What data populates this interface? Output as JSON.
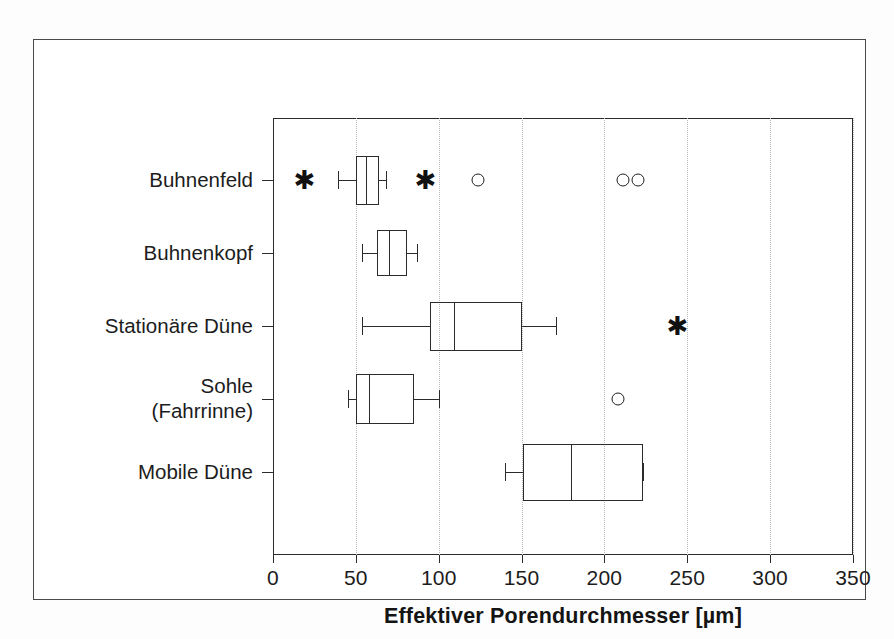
{
  "chart_data": {
    "type": "box",
    "title": "",
    "xlabel": "Effektiver Porendurchmesser [µm]",
    "ylabel": "",
    "xlim": [
      0,
      350
    ],
    "xticks": [
      0,
      50,
      100,
      150,
      200,
      250,
      300,
      350
    ],
    "xticklabels": [
      "0",
      "50",
      "100",
      "150",
      "200",
      "250",
      "300",
      "350"
    ],
    "grid": "vertical dotted gridlines at each x tick",
    "orientation": "horizontal",
    "legend": "none",
    "categories": [
      "Buhnenfeld",
      "Buhnenkopf",
      "Stationäre Düne",
      "Sohle\n(Fahrrinne)",
      "Mobile Düne"
    ],
    "boxes": [
      {
        "category": "Buhnenfeld",
        "whisker_low": 39,
        "q1": 50,
        "median": 56,
        "q3": 64,
        "whisker_high": 68,
        "outliers_circle": [
          124,
          211,
          220
        ],
        "outliers_star": [
          19,
          92
        ]
      },
      {
        "category": "Buhnenkopf",
        "whisker_low": 54,
        "q1": 63,
        "median": 70,
        "q3": 81,
        "whisker_high": 87,
        "outliers_circle": [],
        "outliers_star": []
      },
      {
        "category": "Stationäre Düne",
        "whisker_low": 54,
        "q1": 95,
        "median": 109,
        "q3": 150,
        "whisker_high": 171,
        "outliers_circle": [],
        "outliers_star": [
          244
        ]
      },
      {
        "category": "Sohle\n(Fahrrinne)",
        "whisker_low": 45,
        "q1": 50,
        "median": 58,
        "q3": 85,
        "whisker_high": 100,
        "outliers_circle": [
          208
        ],
        "outliers_star": []
      },
      {
        "category": "Mobile Düne",
        "whisker_low": 140,
        "q1": 151,
        "median": 180,
        "q3": 223,
        "whisker_high": 223,
        "outliers_circle": [],
        "outliers_star": []
      }
    ]
  },
  "axis": {
    "x_title": "Effektiver Porendurchmesser [µm]",
    "tick_labels": [
      "0",
      "50",
      "100",
      "150",
      "200",
      "250",
      "300",
      "350"
    ],
    "category_labels": [
      {
        "line1": "Buhnenfeld",
        "line2": ""
      },
      {
        "line1": "Buhnenkopf",
        "line2": ""
      },
      {
        "line1": "Stationäre Düne",
        "line2": ""
      },
      {
        "line1": "Sohle",
        "line2": "(Fahrrinne)"
      },
      {
        "line1": "Mobile Düne",
        "line2": ""
      }
    ]
  },
  "colors": {
    "line": "#2b2b2b",
    "grid": "#b9b9b9",
    "frame": "#4a4a4a",
    "background": "#ffffff"
  },
  "icons": {
    "outlier_star": "✱",
    "outlier_circle": "circle-outline"
  }
}
